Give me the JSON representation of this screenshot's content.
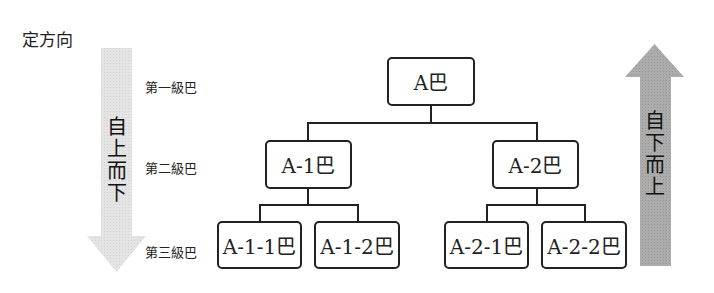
{
  "title": "定方向",
  "levels": [
    "第一級巴",
    "第二級巴",
    "第三級巴"
  ],
  "arrows": {
    "left": {
      "label": [
        "自",
        "上",
        "而",
        "下"
      ],
      "direction": "down",
      "color": "#e0e0e0"
    },
    "right": {
      "label": [
        "自",
        "下",
        "而",
        "上"
      ],
      "direction": "up",
      "color": "#a8a8a8"
    }
  },
  "tree": {
    "root": "A巴",
    "level2": [
      "A-1巴",
      "A-2巴"
    ],
    "level3": [
      "A-1-1巴",
      "A-1-2巴",
      "A-2-1巴",
      "A-2-2巴"
    ]
  }
}
